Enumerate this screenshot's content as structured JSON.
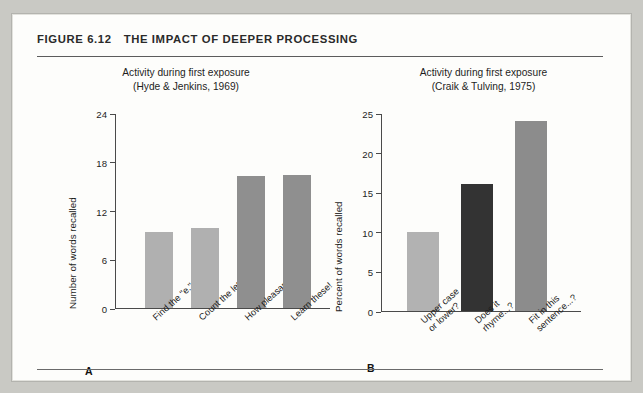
{
  "figure": {
    "number": "FIGURE 6.12",
    "title": "THE IMPACT OF DEEPER PROCESSING"
  },
  "panels": [
    {
      "letter": "A",
      "title_line1": "Activity during first exposure",
      "title_line2": "(Hyde & Jenkins, 1969)"
    },
    {
      "letter": "B",
      "title_line1": "Activity during first exposure",
      "title_line2": "(Craik & Tulving, 1975)"
    }
  ],
  "chart_data": [
    {
      "type": "bar",
      "panel": "A",
      "title": "Activity during first exposure (Hyde & Jenkins, 1969)",
      "xlabel": "",
      "ylabel": "Number of words recalled",
      "ylim": [
        0,
        24
      ],
      "yticks": [
        0,
        6,
        12,
        18,
        24
      ],
      "ytick_labels": [
        "0",
        "6",
        "12",
        "18",
        "24"
      ],
      "grid": false,
      "legend": "none",
      "categories": [
        "Find the \"e.\"",
        "Count the letters.",
        "How pleasant?",
        "Learn these!"
      ],
      "category_lines": [
        [
          "Find the \"e.\""
        ],
        [
          "Count the letters."
        ],
        [
          "How pleasant?"
        ],
        [
          "Learn these!"
        ]
      ],
      "values": [
        9.3,
        9.9,
        16.3,
        16.4
      ],
      "bar_colors": [
        "#b0b0b0",
        "#b0b0b0",
        "#8f8f8f",
        "#8f8f8f"
      ]
    },
    {
      "type": "bar",
      "panel": "B",
      "title": "Activity during first exposure (Craik & Tulving, 1975)",
      "xlabel": "",
      "ylabel": "Percent of words recalled",
      "ylim": [
        0,
        25
      ],
      "yticks": [
        0,
        5,
        10,
        15,
        20,
        25
      ],
      "ytick_labels": [
        "0",
        "5",
        "10",
        "15",
        "20",
        "25"
      ],
      "grid": false,
      "legend": "none",
      "categories": [
        "Upper case or lower?",
        "Does it rhyme...?",
        "Fit in this sentence...?"
      ],
      "category_lines": [
        [
          "Upper case",
          "or lower?"
        ],
        [
          "Does it",
          "rhyme...?"
        ],
        [
          "Fit in this",
          "sentence...?"
        ]
      ],
      "values": [
        10,
        16,
        24
      ],
      "bar_colors": [
        "#b2b2b2",
        "#333333",
        "#8c8c8c"
      ]
    }
  ],
  "colors": {
    "page_background": "#c9c9c4",
    "card_background": "#fdfdfb",
    "card_border": "#b3b3ae",
    "rule": "#5c5c5c",
    "axis": "#4a4a4a",
    "text": "#1d1d1d"
  }
}
